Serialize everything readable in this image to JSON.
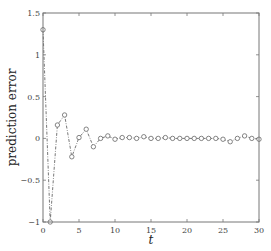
{
  "chart_data": {
    "type": "line",
    "title": "",
    "xlabel": "t",
    "ylabel": "prediction error",
    "xlim": [
      0,
      30
    ],
    "ylim": [
      -1,
      1.5
    ],
    "xticks": [
      0,
      5,
      10,
      15,
      20,
      25,
      30
    ],
    "yticks": [
      -1,
      -0.5,
      0,
      0.5,
      1,
      1.5
    ],
    "xtick_labels": [
      "0",
      "5",
      "10",
      "15",
      "20",
      "25",
      "30"
    ],
    "ytick_labels": [
      "−1",
      "−0.5",
      "0",
      "0.5",
      "1",
      "1.5"
    ],
    "grid": false,
    "legend": null,
    "series": [
      {
        "name": "prediction error",
        "style": "dash-dot line with open circle markers",
        "color": "#555555",
        "x": [
          0,
          1,
          2,
          3,
          4,
          5,
          6,
          7,
          8,
          9,
          10,
          11,
          12,
          13,
          14,
          15,
          16,
          17,
          18,
          19,
          20,
          21,
          22,
          23,
          24,
          25,
          26,
          27,
          28,
          29,
          30
        ],
        "values": [
          1.3,
          -1.0,
          0.16,
          0.28,
          -0.22,
          0.01,
          0.11,
          -0.1,
          0.0,
          0.03,
          -0.01,
          0.01,
          0.01,
          0.0,
          0.02,
          0.0,
          0.0,
          0.01,
          0.0,
          0.0,
          0.0,
          0.0,
          0.0,
          0.0,
          0.0,
          -0.01,
          -0.04,
          0.0,
          0.03,
          0.0,
          -0.01
        ]
      }
    ]
  }
}
